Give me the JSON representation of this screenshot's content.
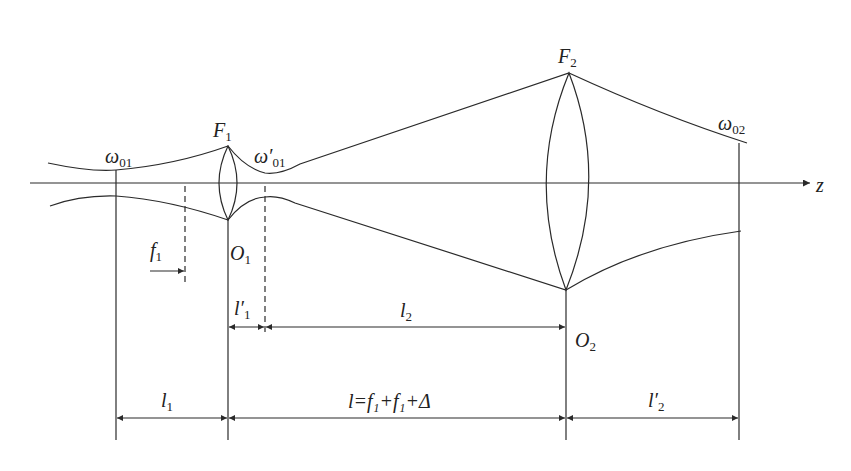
{
  "diagram": {
    "stroke_color": "#2a2a2a",
    "background": "#ffffff",
    "axis": {
      "label": "z"
    },
    "labels": {
      "w01": {
        "main": "ω",
        "sub": "01"
      },
      "w01p": {
        "main": "ω′",
        "sub": "01"
      },
      "w02": {
        "main": "ω",
        "sub": "02"
      },
      "F1": {
        "main": "F",
        "sub": "1"
      },
      "F2": {
        "main": "F",
        "sub": "2"
      },
      "O1": {
        "main": "O",
        "sub": "1"
      },
      "O2": {
        "main": "O",
        "sub": "2"
      },
      "f1": {
        "main": "f",
        "sub": "1"
      },
      "l1p": {
        "main": "l′",
        "sub": "1"
      },
      "l2": {
        "main": "l",
        "sub": "2"
      },
      "l1": {
        "main": "l",
        "sub": "1"
      },
      "l_total": {
        "text": "l=f₁+f₁+Δ"
      },
      "l2p": {
        "main": "l′",
        "sub": "2"
      }
    }
  }
}
